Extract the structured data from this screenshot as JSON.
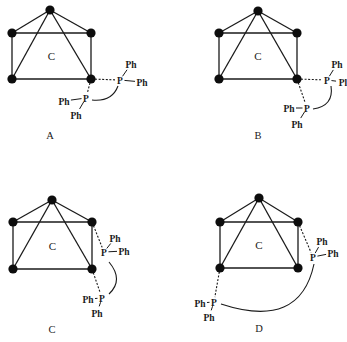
{
  "figure": {
    "panels": [
      {
        "id": "A",
        "caption": "A",
        "center_atom": "C",
        "apex": [
          50,
          10
        ],
        "base": [
          [
            12,
            33
          ],
          [
            91,
            33
          ],
          [
            91,
            79
          ],
          [
            12,
            79
          ]
        ],
        "phosphorus": [
          {
            "label": "P",
            "pos": [
              120,
              80
            ],
            "bonded_to_vertex": [
              91,
              79
            ],
            "substituents": [
              {
                "label": "Ph",
                "pos": [
                  131,
                  64
                ]
              },
              {
                "label": "Ph",
                "pos": [
                  142,
                  82
                ]
              }
            ]
          },
          {
            "label": "P",
            "pos": [
              86,
              98
            ],
            "bonded_to_vertex": [
              91,
              79
            ],
            "substituents": [
              {
                "label": "Ph",
                "pos": [
                  64,
                  101
                ]
              },
              {
                "label": "Ph",
                "pos": [
                  76,
                  115
                ]
              }
            ]
          }
        ],
        "backbone_arc": "M 118 86 Q 112 102 92 100"
      },
      {
        "id": "B",
        "caption": "B",
        "center_atom": "C",
        "apex": [
          258,
          11
        ],
        "base": [
          [
            219,
            33
          ],
          [
            297,
            33
          ],
          [
            297,
            79
          ],
          [
            219,
            79
          ]
        ],
        "phosphorus": [
          {
            "label": "P",
            "pos": [
              327,
              80
            ],
            "bonded_to_vertex": [
              297,
              79
            ],
            "substituents": [
              {
                "label": "Ph",
                "pos": [
                  337,
                  64
                ]
              },
              {
                "label": "Pl",
                "pos": [
                  343,
                  82
                ]
              }
            ]
          },
          {
            "label": "P",
            "pos": [
              307,
              108
            ],
            "bonded_to_vertex": [
              297,
              79
            ],
            "substituents": [
              {
                "label": "Ph",
                "pos": [
                  289,
                  108
                ]
              },
              {
                "label": "Ph",
                "pos": [
                  297,
                  124
                ]
              }
            ]
          }
        ],
        "backbone_arc": "M 331 86 Q 334 106 313 109"
      },
      {
        "id": "C",
        "caption": "C",
        "center_atom": "C",
        "apex": [
          52,
          200
        ],
        "base": [
          [
            13,
            222
          ],
          [
            92,
            222
          ],
          [
            92,
            269
          ],
          [
            13,
            269
          ]
        ],
        "phosphorus": [
          {
            "label": "P",
            "pos": [
              104,
              252
            ],
            "bonded_to_vertex": [
              92,
              222
            ],
            "substituents": [
              {
                "label": "Ph",
                "pos": [
                  115,
                  238
                ]
              },
              {
                "label": "Ph",
                "pos": [
                  124,
                  251
                ]
              }
            ]
          },
          {
            "label": "P",
            "pos": [
              102,
              298
            ],
            "bonded_to_vertex": [
              92,
              269
            ],
            "substituents": [
              {
                "label": "Ph",
                "pos": [
                  88,
                  299
                ]
              },
              {
                "label": "Ph",
                "pos": [
                  97,
                  313
                ]
              }
            ]
          }
        ],
        "backbone_arc": "M 109 262 Q 124 280 109 294"
      },
      {
        "id": "D",
        "caption": "D",
        "center_atom": "C",
        "apex": [
          259,
          198
        ],
        "base": [
          [
            220,
            222
          ],
          [
            298,
            222
          ],
          [
            298,
            268
          ],
          [
            220,
            268
          ]
        ],
        "phosphorus": [
          {
            "label": "P",
            "pos": [
              313,
              257
            ],
            "bonded_to_vertex": [
              298,
              222
            ],
            "substituents": [
              {
                "label": "Ph",
                "pos": [
                  322,
                  241
                ]
              },
              {
                "label": "Ph",
                "pos": [
                  333,
                  253
                ]
              }
            ]
          },
          {
            "label": "P",
            "pos": [
              214,
              302
            ],
            "bonded_to_vertex": [
              220,
              268
            ],
            "substituents": [
              {
                "label": "Ph",
                "pos": [
                  200,
                  303
                ]
              },
              {
                "label": "Ph",
                "pos": [
                  209,
                  317
                ]
              }
            ]
          }
        ],
        "backbone_arc": "M 314 264 Q 300 330 221 304"
      }
    ]
  }
}
